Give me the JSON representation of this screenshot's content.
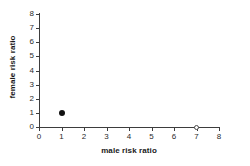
{
  "chart_data": {
    "type": "scatter",
    "title": "",
    "xlabel": "male risk ratio",
    "ylabel": "female risk ratio",
    "xlim": [
      0,
      8
    ],
    "ylim": [
      0,
      8
    ],
    "xticks": [
      "0",
      "1",
      "2",
      "3",
      "4",
      "5",
      "6",
      "7",
      "8"
    ],
    "yticks": [
      "0",
      "1",
      "2",
      "3",
      "4",
      "5",
      "6",
      "7",
      "8"
    ],
    "grid": false,
    "legend": null,
    "series": [
      {
        "name": "observed",
        "marker": "filled-circle",
        "color": "#111111",
        "points": [
          {
            "x": 1,
            "y": 1
          }
        ]
      },
      {
        "name": "axis-marker",
        "marker": "open-circle",
        "color": "#4a4a4a",
        "points": [
          {
            "x": 7,
            "y": 0
          }
        ]
      }
    ]
  },
  "colors": {
    "background": "#ffffff",
    "axis": "#3d3d3d",
    "text": "#1a1a1a",
    "ticktext": "#2b2b2b",
    "marker_filled": "#111111",
    "marker_open": "#4a4a4a"
  }
}
